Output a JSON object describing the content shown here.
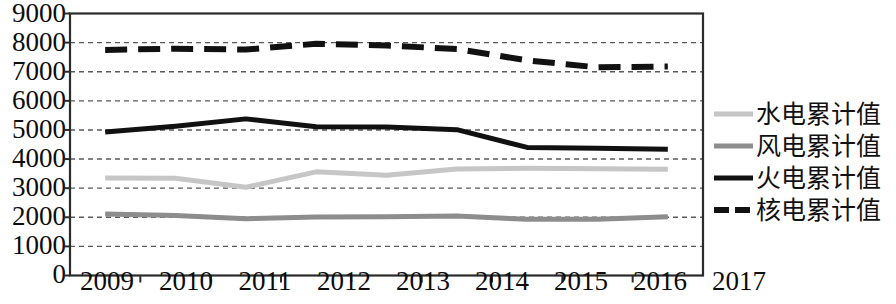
{
  "chart_data": {
    "type": "line",
    "title": "",
    "xlabel": "",
    "ylabel": "",
    "categories": [
      "2009",
      "2010",
      "2011",
      "2012",
      "2013",
      "2014",
      "2015",
      "2016",
      "2017"
    ],
    "ylim": [
      0,
      9000
    ],
    "ytick_step": 1000,
    "yticks": [
      "9000",
      "8000",
      "7000",
      "6000",
      "5000",
      "4000",
      "3000",
      "2000",
      "1000",
      "0"
    ],
    "grid": "horizontal-dashed",
    "legend_position": "right",
    "series": [
      {
        "name": "水电累计值",
        "values": [
          3350,
          3340,
          3030,
          3560,
          3440,
          3660,
          3680,
          3670,
          3650
        ],
        "color": "#c6c6c6",
        "style": "solid",
        "width": 5
      },
      {
        "name": "风电累计值",
        "values": [
          2110,
          2060,
          1950,
          2010,
          2020,
          2040,
          1930,
          1930,
          2020
        ],
        "color": "#8d8d8d",
        "style": "solid",
        "width": 5
      },
      {
        "name": "火电累计值",
        "values": [
          4930,
          5130,
          5380,
          5110,
          5100,
          5010,
          4400,
          4370,
          4340
        ],
        "color": "#111111",
        "style": "solid",
        "width": 5
      },
      {
        "name": "核电累计值",
        "values": [
          7750,
          7790,
          7760,
          7960,
          7900,
          7780,
          7390,
          7150,
          7180
        ],
        "color": "#111111",
        "style": "dashed",
        "width": 6
      }
    ]
  },
  "plot": {
    "frame_color": "#2b2b2b",
    "grid_color": "#5a5a5a",
    "background": "#ffffff"
  }
}
